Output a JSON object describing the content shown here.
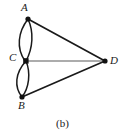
{
  "figure": {
    "caption": "(b)",
    "background_color": "#ffffff",
    "stroke_color": "#1a1a1a",
    "thin_stroke_color": "#5a5a5a",
    "width": 125,
    "height": 137
  },
  "graph": {
    "type": "multigraph",
    "nodes": [
      {
        "id": "A",
        "label": "A",
        "x": 28,
        "y": 19
      },
      {
        "id": "B",
        "label": "B",
        "x": 22,
        "y": 97
      },
      {
        "id": "C",
        "label": "C",
        "x": 26,
        "y": 61
      },
      {
        "id": "D",
        "label": "D",
        "x": 105,
        "y": 61
      }
    ],
    "edges": [
      {
        "from": "A",
        "to": "C",
        "style": "curved-left",
        "multiplicity_index": 1
      },
      {
        "from": "A",
        "to": "C",
        "style": "curved-right",
        "multiplicity_index": 2
      },
      {
        "from": "C",
        "to": "B",
        "style": "curved-left",
        "multiplicity_index": 1
      },
      {
        "from": "C",
        "to": "B",
        "style": "curved-right",
        "multiplicity_index": 2
      },
      {
        "from": "A",
        "to": "D",
        "style": "straight",
        "multiplicity_index": 1
      },
      {
        "from": "C",
        "to": "D",
        "style": "straight-thin",
        "multiplicity_index": 1
      },
      {
        "from": "B",
        "to": "D",
        "style": "straight",
        "multiplicity_index": 1
      }
    ],
    "edge_count": 7,
    "node_count": 4,
    "degrees": {
      "A": 3,
      "B": 3,
      "C": 5,
      "D": 3
    }
  }
}
